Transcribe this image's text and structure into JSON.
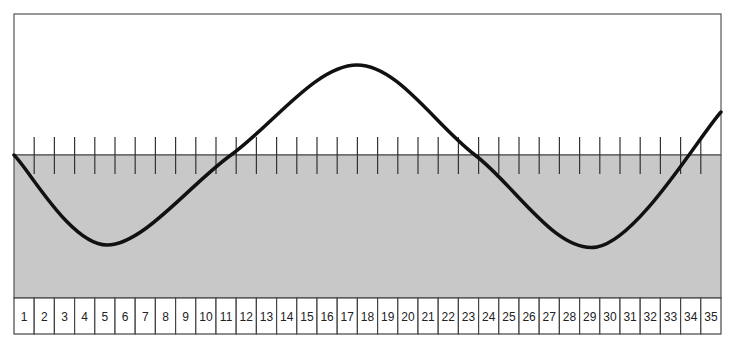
{
  "diagram": {
    "colors": {
      "background": "#ffffff",
      "water": "#c8c8c8",
      "wave": "#111111",
      "lines": "#444444"
    },
    "frame": {
      "left": 14,
      "top": 14,
      "right": 721,
      "waterline_y": 155,
      "water_bottom_y": 298,
      "bottom_y": 334
    },
    "ticks": {
      "count": 34,
      "top_y": 137,
      "bottom_y": 174
    },
    "wave_points": [
      {
        "x": 14,
        "y": 155
      },
      {
        "x": 107,
        "y": 245
      },
      {
        "x": 231,
        "y": 155
      },
      {
        "x": 357,
        "y": 65
      },
      {
        "x": 475,
        "y": 155
      },
      {
        "x": 597,
        "y": 247
      },
      {
        "x": 721,
        "y": 112
      }
    ],
    "cells": [
      "1",
      "2",
      "3",
      "4",
      "5",
      "6",
      "7",
      "8",
      "9",
      "10",
      "11",
      "12",
      "13",
      "14",
      "15",
      "16",
      "17",
      "18",
      "19",
      "20",
      "21",
      "22",
      "23",
      "24",
      "25",
      "26",
      "27",
      "28",
      "29",
      "30",
      "31",
      "32",
      "33",
      "34",
      "35"
    ]
  }
}
